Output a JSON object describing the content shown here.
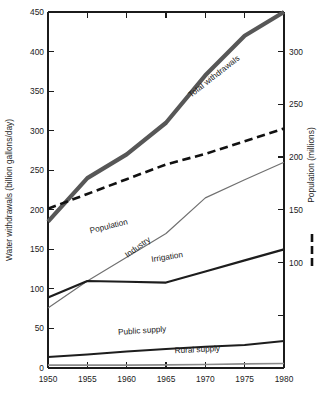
{
  "chart_data": {
    "type": "line",
    "title": "",
    "xlabel": "",
    "ylabel": "Water withdrawals (billion gallons/day)",
    "y2label": "Population (millions)",
    "x": [
      1950,
      1955,
      1960,
      1965,
      1970,
      1975,
      1980
    ],
    "xlim": [
      1950,
      1980
    ],
    "ylim": [
      0,
      450
    ],
    "y2lim": [
      0,
      337.5
    ],
    "grid": false,
    "legend": "inline-labels",
    "xticks": [
      "1950",
      "1955",
      "1960",
      "1965",
      "1970",
      "1975",
      "1980"
    ],
    "yticks": [
      "0",
      "50",
      "100",
      "150",
      "200",
      "250",
      "300",
      "350",
      "400",
      "450"
    ],
    "y2ticks": [
      "",
      "100",
      "150",
      "200",
      "250",
      "300"
    ],
    "y2tick_values": [
      50,
      100,
      150,
      200,
      250,
      300
    ],
    "series": [
      {
        "name": "Total withdrawals",
        "axis": "left",
        "style": "solid",
        "color": "#575757",
        "width": 4.2,
        "label_x": 1971.3,
        "label_y": 366,
        "label_rotate": -38,
        "values": [
          185,
          240,
          270,
          310,
          370,
          420,
          450
        ]
      },
      {
        "name": "Population",
        "axis": "right",
        "style": "dashed",
        "color": "#111111",
        "width": 2.6,
        "label_x": 1957.8,
        "label_y": 176,
        "label_rotate": -14,
        "values": [
          151,
          165,
          179,
          193,
          203,
          215,
          227
        ]
      },
      {
        "name": "Industry",
        "axis": "left",
        "style": "solid",
        "color": "#707070",
        "width": 1.2,
        "label_x": 1961.6,
        "label_y": 150,
        "label_rotate": -36,
        "values": [
          76,
          110,
          140,
          170,
          215,
          238,
          260
        ]
      },
      {
        "name": "Irrigation",
        "axis": "left",
        "style": "solid",
        "color": "#1d1d1d",
        "width": 2.2,
        "label_x": 1965.2,
        "label_y": 137,
        "label_rotate": -9,
        "values": [
          89,
          110,
          109,
          108,
          122,
          136,
          150
        ]
      },
      {
        "name": "Public supply",
        "axis": "left",
        "style": "solid",
        "color": "#1d1d1d",
        "width": 2.0,
        "label_x": 1962.0,
        "label_y": 44,
        "label_rotate": -4,
        "values": [
          14,
          17,
          21,
          24,
          27,
          29,
          34
        ]
      },
      {
        "name": "Rural supply",
        "axis": "left",
        "style": "solid",
        "color": "#8a8a8a",
        "width": 1.6,
        "label_x": 1969.0,
        "label_y": 20,
        "label_rotate": -3,
        "values": [
          3.6,
          3.6,
          3.6,
          4.0,
          4.5,
          5.2,
          5.6
        ]
      }
    ],
    "right_legend": {
      "label": "Population (millions)",
      "key_style": "dashed",
      "key_color": "#111111"
    }
  }
}
